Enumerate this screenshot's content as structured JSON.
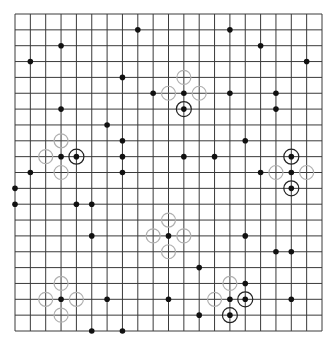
{
  "board": {
    "size": 21,
    "origin_x": 15,
    "origin_y": 14,
    "end_x": 322,
    "end_y": 331,
    "line_color": "#3a3a3a",
    "stone_color": "#111111",
    "ring_color": "#222222",
    "ghost_color": "#b0b0b0",
    "background": "#ffffff"
  },
  "stones": [
    [
      8,
      1
    ],
    [
      14,
      1
    ],
    [
      3,
      2
    ],
    [
      16,
      2
    ],
    [
      1,
      3
    ],
    [
      19,
      3
    ],
    [
      7,
      4
    ],
    [
      9,
      5
    ],
    [
      11,
      5
    ],
    [
      14,
      5
    ],
    [
      17,
      5
    ],
    [
      3,
      6
    ],
    [
      17,
      6
    ],
    [
      6,
      7
    ],
    [
      7,
      8
    ],
    [
      15,
      8
    ],
    [
      3,
      9
    ],
    [
      7,
      9
    ],
    [
      11,
      9
    ],
    [
      13,
      9
    ],
    [
      1,
      10
    ],
    [
      7,
      10
    ],
    [
      16,
      10
    ],
    [
      18,
      10
    ],
    [
      0,
      11
    ],
    [
      0,
      12
    ],
    [
      4,
      12
    ],
    [
      5,
      12
    ],
    [
      5,
      14
    ],
    [
      10,
      14
    ],
    [
      15,
      14
    ],
    [
      17,
      15
    ],
    [
      18,
      15
    ],
    [
      12,
      16
    ],
    [
      15,
      17
    ],
    [
      3,
      18
    ],
    [
      6,
      18
    ],
    [
      10,
      18
    ],
    [
      14,
      18
    ],
    [
      18,
      18
    ],
    [
      12,
      19
    ],
    [
      5,
      20
    ],
    [
      7,
      20
    ]
  ],
  "highlighted_stones": [
    [
      11,
      6
    ],
    [
      4,
      9
    ],
    [
      18,
      9
    ],
    [
      18,
      11
    ],
    [
      15,
      18
    ],
    [
      14,
      19
    ]
  ],
  "ghost_markers": [
    [
      11,
      4
    ],
    [
      10,
      5
    ],
    [
      12,
      5
    ],
    [
      3,
      8
    ],
    [
      2,
      9
    ],
    [
      3,
      10
    ],
    [
      17,
      10
    ],
    [
      19,
      10
    ],
    [
      10,
      13
    ],
    [
      9,
      14
    ],
    [
      11,
      14
    ],
    [
      10,
      15
    ],
    [
      3,
      17
    ],
    [
      2,
      18
    ],
    [
      4,
      18
    ],
    [
      3,
      19
    ],
    [
      14,
      17
    ],
    [
      13,
      18
    ]
  ]
}
